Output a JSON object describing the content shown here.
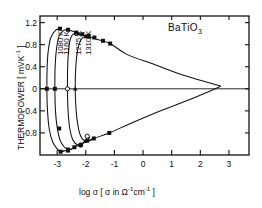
{
  "chart_data": {
    "type": "line",
    "title": "BaTiO3",
    "title_display": "BaTiO₃",
    "xlabel": "log σ [ σ in Ω⁻¹cm⁻¹ ]",
    "ylabel": "THERMOPOWER [ mVK⁻¹ ]",
    "xlim": [
      -3.6,
      3.7
    ],
    "ylim": [
      -1.2,
      1.32
    ],
    "xticks": [
      -3,
      -2,
      -1,
      0,
      1,
      2,
      3
    ],
    "xticklabels": [
      "-3",
      "-2",
      "-1",
      "0",
      "1",
      "2",
      "3"
    ],
    "yticks": [
      1.2,
      0.8,
      0.4,
      0,
      -0.4,
      -0.8
    ],
    "yticklabels": [
      "1.2",
      "0.8",
      "0.4",
      "0",
      "-0.4",
      "-0.8"
    ],
    "grid": false,
    "legend_position": "inline-curve-labels",
    "zero_line": true,
    "series": [
      {
        "name": "1080 K",
        "label": "1080 K",
        "label_x": -3.04,
        "label_y": 0.62,
        "marker": "filled-square",
        "points": [
          [
            -2.9,
            1.09
          ],
          [
            -3.06,
            1.06
          ],
          [
            -3.22,
            0.93
          ],
          [
            -3.31,
            0.7
          ],
          [
            -3.35,
            0.4
          ],
          [
            -3.36,
            0.0
          ],
          [
            -3.34,
            -0.38
          ],
          [
            -3.28,
            -0.72
          ],
          [
            -3.16,
            -0.96
          ],
          [
            -3.0,
            -1.09
          ],
          [
            -2.88,
            -1.14
          ],
          [
            -2.78,
            -1.13
          ]
        ],
        "data_markers": [
          [
            -2.9,
            1.09
          ],
          [
            -3.36,
            0.0
          ],
          [
            -2.88,
            -1.14
          ]
        ]
      },
      {
        "name": "1160 K",
        "label": "1160 K",
        "label_x": -2.82,
        "label_y": 0.62,
        "marker": "filled-square",
        "points": [
          [
            -2.62,
            1.07
          ],
          [
            -2.78,
            1.06
          ],
          [
            -2.93,
            0.96
          ],
          [
            -3.02,
            0.74
          ],
          [
            -3.07,
            0.42
          ],
          [
            -3.08,
            0.0
          ],
          [
            -3.06,
            -0.4
          ],
          [
            -3.0,
            -0.7
          ],
          [
            -2.9,
            -0.93
          ],
          [
            -2.76,
            -1.05
          ],
          [
            -2.62,
            -1.1
          ],
          [
            -2.5,
            -1.1
          ]
        ],
        "data_markers": [
          [
            -2.62,
            1.07
          ],
          [
            -3.08,
            0.0
          ],
          [
            -2.93,
            -0.72
          ],
          [
            -2.62,
            -1.1
          ]
        ]
      },
      {
        "name": "1275 K",
        "label": "1275 K",
        "label_x": -2.4,
        "label_y": 0.62,
        "marker": "open-circle",
        "points": [
          [
            -2.16,
            0.96
          ],
          [
            -2.33,
            1.0
          ],
          [
            -2.48,
            0.97
          ],
          [
            -2.58,
            0.8
          ],
          [
            -2.63,
            0.45
          ],
          [
            -2.64,
            0.0
          ],
          [
            -2.62,
            -0.4
          ],
          [
            -2.56,
            -0.72
          ],
          [
            -2.46,
            -0.92
          ],
          [
            -2.32,
            -1.01
          ],
          [
            -2.18,
            -1.02
          ],
          [
            -2.02,
            -0.96
          ],
          [
            -1.86,
            -0.88
          ]
        ],
        "data_markers": [
          [
            -2.33,
            1.0
          ],
          [
            -2.64,
            0.0
          ],
          [
            -2.18,
            -1.02
          ],
          [
            -1.95,
            -0.86
          ]
        ]
      },
      {
        "name": "1310 K",
        "label": "1310 K",
        "label_x": -2.06,
        "label_y": 0.62,
        "marker": "filled-triangle",
        "points": [
          [
            -1.84,
            0.92
          ],
          [
            -2.0,
            0.95
          ],
          [
            -2.16,
            0.9
          ],
          [
            -2.28,
            0.72
          ],
          [
            -2.35,
            0.4
          ],
          [
            -2.37,
            0.0
          ],
          [
            -2.34,
            -0.38
          ],
          [
            -2.27,
            -0.68
          ],
          [
            -2.16,
            -0.88
          ],
          [
            -2.02,
            -0.95
          ],
          [
            -1.88,
            -0.94
          ],
          [
            -1.72,
            -0.9
          ]
        ],
        "data_markers": [
          [
            -2.0,
            0.95
          ],
          [
            -2.37,
            0.0
          ],
          [
            -2.02,
            -0.95
          ]
        ]
      },
      {
        "name": "upper envelope",
        "label": "",
        "marker": "filled-square",
        "points": [
          [
            -2.62,
            1.07
          ],
          [
            -2.33,
            1.02
          ],
          [
            -2.0,
            0.96
          ],
          [
            -1.62,
            0.9
          ],
          [
            -1.15,
            0.82
          ],
          [
            -0.55,
            0.62
          ],
          [
            0.4,
            0.44
          ],
          [
            1.45,
            0.24
          ],
          [
            2.7,
            0.05
          ]
        ],
        "data_markers": [
          [
            -2.33,
            1.02
          ],
          [
            -2.12,
            0.99
          ],
          [
            -1.9,
            0.96
          ],
          [
            -1.7,
            0.93
          ],
          [
            -1.4,
            0.87
          ],
          [
            -1.15,
            0.82
          ]
        ]
      },
      {
        "name": "lower envelope",
        "label": "",
        "marker": "filled-square",
        "points": [
          [
            -2.88,
            -1.14
          ],
          [
            -2.55,
            -1.1
          ],
          [
            -2.26,
            -1.02
          ],
          [
            -2.02,
            -0.96
          ],
          [
            -1.72,
            -0.9
          ],
          [
            -1.18,
            -0.8
          ],
          [
            -0.4,
            -0.62
          ],
          [
            0.7,
            -0.38
          ],
          [
            1.7,
            -0.18
          ],
          [
            2.7,
            0.04
          ]
        ],
        "data_markers": [
          [
            -2.62,
            -1.12
          ],
          [
            -2.4,
            -1.06
          ],
          [
            -2.18,
            -1.02
          ],
          [
            -1.95,
            -0.94
          ],
          [
            -1.72,
            -0.9
          ],
          [
            -1.18,
            -0.8
          ]
        ]
      }
    ]
  }
}
